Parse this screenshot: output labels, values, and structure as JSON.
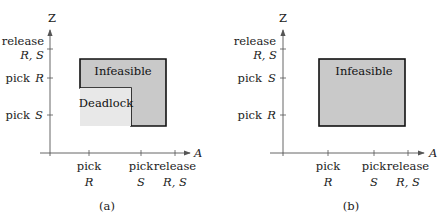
{
  "panels": [
    {
      "id": "a",
      "caption": "(a)",
      "y_axis_label": "Z",
      "x_axis_label": "A",
      "y_ticks": [
        {
          "line1": "pick",
          "line2": "S"
        },
        {
          "line1": "pick",
          "line2": "R"
        },
        {
          "line1": "release",
          "line2": "R, S"
        }
      ],
      "x_ticks": [
        {
          "line1": "pick",
          "line2": "R"
        },
        {
          "line1": "pick",
          "line2": "S"
        },
        {
          "line1": "release",
          "line2": "R, S"
        }
      ],
      "regions": [
        {
          "label": "Infeasible",
          "color": "#c9c9c9"
        },
        {
          "label": "Deadlock",
          "color": "#e8e8e8"
        }
      ]
    },
    {
      "id": "b",
      "caption": "(b)",
      "y_axis_label": "Z",
      "x_axis_label": "A",
      "y_ticks": [
        {
          "line1": "pick",
          "line2": "R"
        },
        {
          "line1": "pick",
          "line2": "S"
        },
        {
          "line1": "release",
          "line2": "R, S"
        }
      ],
      "x_ticks": [
        {
          "line1": "pick",
          "line2": "R"
        },
        {
          "line1": "pick",
          "line2": "S"
        },
        {
          "line1": "release",
          "line2": "R, S"
        }
      ],
      "regions": [
        {
          "label": "Infeasible",
          "color": "#c9c9c9"
        }
      ]
    }
  ]
}
